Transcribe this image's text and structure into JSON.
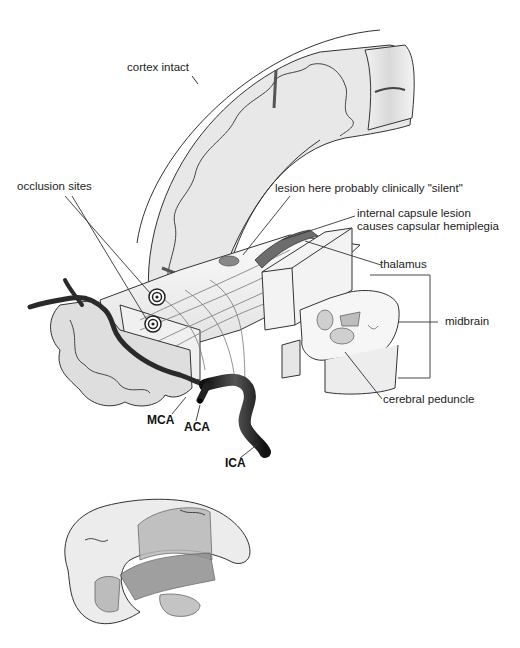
{
  "figure": {
    "main_view": "Coronal cutaway of cerebral hemisphere, internal capsule, thalamus and midbrain with arterial supply",
    "inset_view": "Lateral view of hemisphere showing deep structures"
  },
  "labels": {
    "cortex_intact": "cortex intact",
    "occlusion_sites": "occlusion sites",
    "lesion_silent": "lesion here probably clinically \"silent\"",
    "internal_capsule_line1": "internal capsule lesion",
    "internal_capsule_line2": "causes capsular hemiplegia",
    "thalamus": "thalamus",
    "midbrain": "midbrain",
    "cerebral_peduncle": "cerebral peduncle",
    "mca": "MCA",
    "aca": "ACA",
    "ica": "ICA"
  },
  "colors": {
    "cortex_fill": "#e9e9e9",
    "white_matter": "#f7f7f7",
    "vessel": "#2a2a2a",
    "lesion": "#7a7a7a",
    "outline": "#333333",
    "inset_dark": "#8c8c8c",
    "inset_mid": "#b5b5b5"
  }
}
